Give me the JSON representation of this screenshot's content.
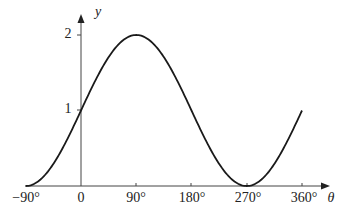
{
  "chart_data": {
    "type": "line",
    "title": "",
    "function": "y = 1 + sin θ",
    "xlabel": "θ",
    "ylabel": "y",
    "x_ticks": [
      "-90°",
      "0",
      "90°",
      "180°",
      "270°",
      "360°"
    ],
    "y_ticks": [
      "1",
      "2"
    ],
    "xlim": [
      -90,
      360
    ],
    "ylim": [
      0,
      2
    ],
    "grid": false,
    "series": [
      {
        "name": "curve",
        "x": [
          -90,
          -45,
          0,
          45,
          90,
          135,
          180,
          225,
          270,
          315,
          360
        ],
        "values": [
          0,
          0.29,
          1,
          1.71,
          2,
          1.71,
          1,
          0.29,
          0,
          0.29,
          1
        ]
      }
    ]
  },
  "labels": {
    "x_axis": "θ",
    "y_axis": "y",
    "x_ticks": [
      "−90°",
      "0",
      "90°",
      "180°",
      "270°",
      "360°"
    ],
    "y_tick_1": "1",
    "y_tick_2": "2"
  }
}
